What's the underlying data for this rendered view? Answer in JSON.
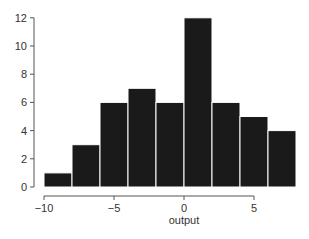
{
  "chart_data": {
    "type": "bar",
    "subtype": "histogram",
    "title": "",
    "xlabel": "output",
    "ylabel": "",
    "bin_edges": [
      -10,
      -8,
      -6,
      -4,
      -2,
      0,
      2,
      4,
      6,
      8
    ],
    "categories": [
      "[-10,-8)",
      "[-8,-6)",
      "[-6,-4)",
      "[-4,-2)",
      "[-2,0)",
      "[0,2)",
      "[2,4)",
      "[4,6)",
      "[6,8)"
    ],
    "values": [
      1,
      3,
      6,
      7,
      6,
      12,
      6,
      5,
      4
    ],
    "xlim": [
      -10,
      8
    ],
    "ylim": [
      0,
      12
    ],
    "x_ticks": [
      -10,
      -5,
      0,
      5
    ],
    "x_tick_labels": [
      "−10",
      "−5",
      "0",
      "5"
    ],
    "y_ticks": [
      0,
      2,
      4,
      6,
      8,
      10,
      12
    ],
    "y_tick_labels": [
      "0",
      "2",
      "4",
      "6",
      "8",
      "10",
      "12"
    ],
    "grid": false,
    "legend": null,
    "bar_color": "#1a1a1a",
    "bar_edge_color": "#ffffff"
  }
}
